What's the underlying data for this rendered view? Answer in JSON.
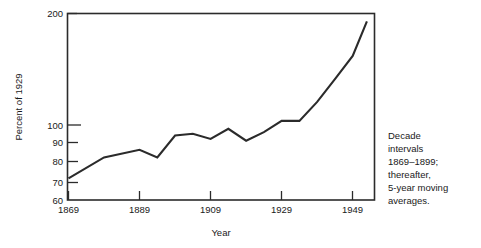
{
  "chart_data": {
    "type": "line",
    "title": "",
    "xlabel": "Year",
    "ylabel": "Percent of 1929",
    "yscale": "log",
    "ylim": [
      60,
      200
    ],
    "xlim": [
      1869,
      1955
    ],
    "grid": false,
    "legend": null,
    "ytick_labels": [
      "200",
      "100",
      "90",
      "80",
      "70",
      "60"
    ],
    "ytick_values": [
      200,
      100,
      90,
      80,
      70,
      60
    ],
    "xtick_labels": [
      "1869",
      "1889",
      "1909",
      "1929",
      "1949"
    ],
    "xtick_values": [
      1869,
      1889,
      1909,
      1929,
      1949
    ],
    "annotation": "Decade intervals 1869-1899; thereafter, 5-year moving averages.",
    "annotation_lines": [
      "Decade",
      "intervals",
      "1869–1899;",
      "thereafter,",
      "5-year moving",
      "averages."
    ],
    "series": [
      {
        "name": "Percent of 1929",
        "color": "#2b2b2b",
        "x": [
          1869,
          1879,
          1889,
          1894,
          1899,
          1904,
          1909,
          1914,
          1919,
          1924,
          1929,
          1934,
          1939,
          1944,
          1949,
          1953
        ],
        "values": [
          69,
          79,
          83,
          79,
          91,
          92,
          89,
          95,
          88,
          93,
          100,
          100,
          113,
          131,
          152,
          190
        ]
      }
    ]
  },
  "axis": {
    "y_title": "Percent of 1929",
    "x_title": "Year"
  }
}
